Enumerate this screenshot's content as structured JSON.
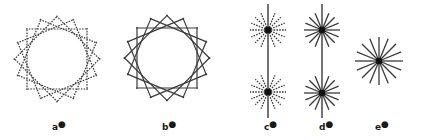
{
  "figures": [
    {
      "id": "a",
      "label": "a",
      "mark": "●",
      "type": "tangent-circle",
      "style": "dashed",
      "cx": 57,
      "cy": 59,
      "r": 30,
      "lines": 16,
      "half_len": 31,
      "label_x": 52,
      "label_y": 120
    },
    {
      "id": "b",
      "label": "b",
      "mark": "●",
      "type": "tangent-circle",
      "style": "solid",
      "cx": 167,
      "cy": 58,
      "r": 30,
      "lines": 16,
      "half_len": 31,
      "label_x": 162,
      "label_y": 120
    },
    {
      "id": "c",
      "label": "c",
      "mark": "●",
      "type": "double-star",
      "style": "dashed",
      "cx": 268,
      "cy1": 30,
      "cy2": 92,
      "ray": 18,
      "rays": 16,
      "line_top": 4,
      "line_bottom": 118,
      "label_x": 264,
      "label_y": 120
    },
    {
      "id": "d",
      "label": "d",
      "mark": "●",
      "type": "double-star",
      "style": "solid",
      "cx": 322,
      "cy1": 30,
      "cy2": 93,
      "ray": 18,
      "rays": 16,
      "line_top": 4,
      "line_bottom": 118,
      "label_x": 319,
      "label_y": 120
    },
    {
      "id": "e",
      "label": "e",
      "mark": "●",
      "type": "star",
      "style": "solid",
      "cx": 379,
      "cy": 61,
      "ray": 24,
      "rays": 16,
      "label_x": 375,
      "label_y": 120
    }
  ],
  "colors": {
    "stroke": "#3a3a3a",
    "dot": "#111111",
    "background": "#ffffff"
  }
}
